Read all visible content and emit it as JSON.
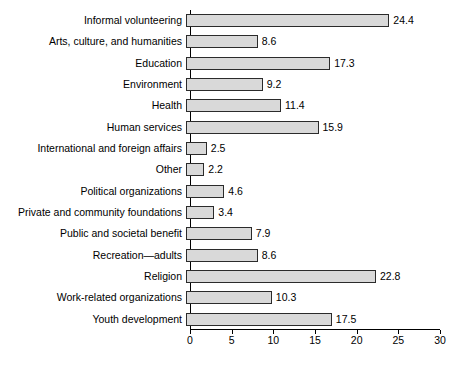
{
  "chart_data": {
    "type": "bar",
    "orientation": "horizontal",
    "title": "",
    "subtitle": "",
    "xlabel": "",
    "ylabel": "",
    "xlim": [
      0,
      30
    ],
    "xticks": [
      0,
      5,
      10,
      15,
      20,
      25,
      30
    ],
    "grid": false,
    "legend": null,
    "bar_fill_color": "#d9d9d9",
    "bar_edge_color": "#2b2b2b",
    "categories": [
      "Informal volunteering",
      "Arts, culture, and humanities",
      "Education",
      "Environment",
      "Health",
      "Human services",
      "International and foreign affairs",
      "Other",
      "Political organizations",
      "Private and community foundations",
      "Public and societal benefit",
      "Recreation—adults",
      "Religion",
      "Work-related organizations",
      "Youth development"
    ],
    "values": [
      24.4,
      8.6,
      17.3,
      9.2,
      11.4,
      15.9,
      2.5,
      2.2,
      4.6,
      3.4,
      7.9,
      8.6,
      22.8,
      10.3,
      17.5
    ],
    "value_labels": [
      "24.4",
      "8.6",
      "17.3",
      "9.2",
      "11.4",
      "15.9",
      "2.5",
      "2.2",
      "4.6",
      "3.4",
      "7.9",
      "8.6",
      "22.8",
      "10.3",
      "17.5"
    ],
    "tick_labels": [
      "0",
      "5",
      "10",
      "15",
      "20",
      "25",
      "30"
    ]
  }
}
